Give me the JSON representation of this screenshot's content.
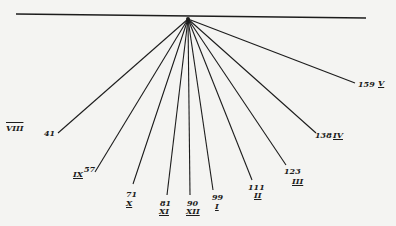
{
  "diagram": {
    "colors": {
      "background": "#f4f4f2",
      "ink": "#1c1c1c"
    },
    "baseline": {
      "x1": 16,
      "y1": 14,
      "x2": 366,
      "y2": 18
    },
    "apex": {
      "x": 188,
      "y": 19
    },
    "rays": [
      {
        "value": "41",
        "hour": "VIII",
        "x": 58,
        "y": 133,
        "num_pos": [
          44,
          129
        ],
        "hour_pos": [
          6,
          124
        ],
        "hour_style": "over"
      },
      {
        "value": "57",
        "hour": "IX",
        "x": 95,
        "y": 172,
        "num_pos": [
          84,
          165
        ],
        "hour_pos": [
          73,
          170
        ],
        "hour_style": "under"
      },
      {
        "value": "71",
        "hour": "X",
        "x": 133,
        "y": 184,
        "num_pos": [
          126,
          190
        ],
        "hour_pos": [
          126,
          199
        ],
        "hour_style": "under"
      },
      {
        "value": "81",
        "hour": "XI",
        "x": 167,
        "y": 195,
        "num_pos": [
          160,
          199
        ],
        "hour_pos": [
          159,
          207
        ],
        "hour_style": "under"
      },
      {
        "value": "90",
        "hour": "XII",
        "x": 190,
        "y": 195,
        "num_pos": [
          187,
          199
        ],
        "hour_pos": [
          186,
          207
        ],
        "hour_style": "under"
      },
      {
        "value": "99",
        "hour": "I",
        "x": 213,
        "y": 190,
        "num_pos": [
          212,
          193
        ],
        "hour_pos": [
          215,
          202
        ],
        "hour_style": "under"
      },
      {
        "value": "111",
        "hour": "II",
        "x": 252,
        "y": 180,
        "num_pos": [
          248,
          183
        ],
        "hour_pos": [
          254,
          191
        ],
        "hour_style": "under"
      },
      {
        "value": "123",
        "hour": "III",
        "x": 286,
        "y": 165,
        "num_pos": [
          284,
          167
        ],
        "hour_pos": [
          292,
          177
        ],
        "hour_style": "under"
      },
      {
        "value": "138",
        "hour": "IV",
        "x": 316,
        "y": 133,
        "num_pos": [
          315,
          131
        ],
        "hour_pos": [
          333,
          131
        ],
        "hour_style": "under"
      },
      {
        "value": "159",
        "hour": "V",
        "x": 355,
        "y": 83,
        "num_pos": [
          358,
          80
        ],
        "hour_pos": [
          378,
          79
        ],
        "hour_style": "under"
      }
    ]
  }
}
